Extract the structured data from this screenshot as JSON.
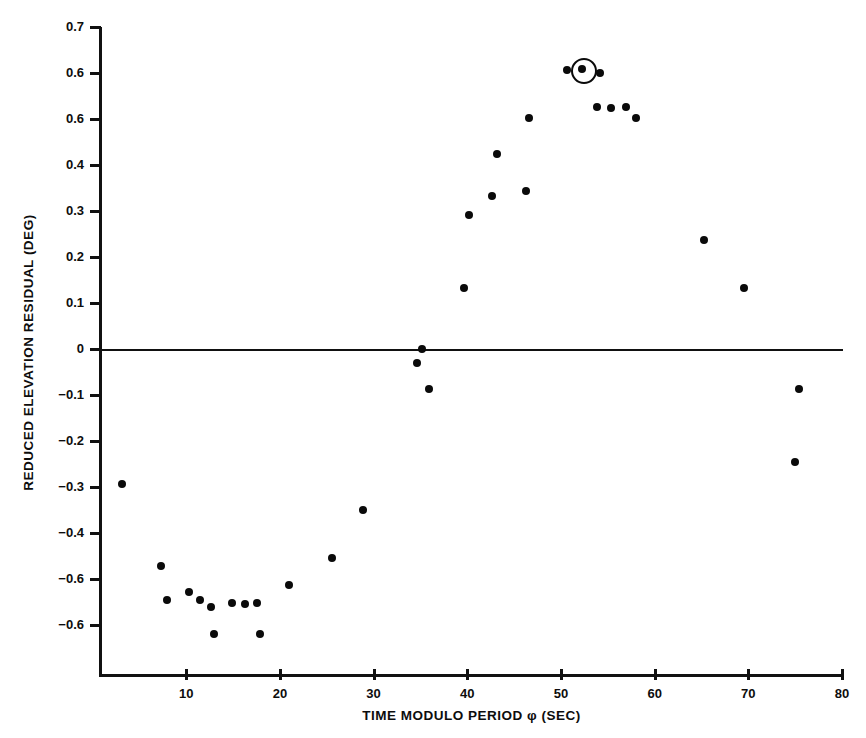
{
  "chart_data": {
    "type": "scatter",
    "title": "",
    "xlabel": "TIME MODULO PERIOD φ (SEC)",
    "ylabel": "REDUCED ELEVATION RESIDUAL (DEG)",
    "xlim": [
      0.9,
      80
    ],
    "ylim": [
      -0.66,
      0.7
    ],
    "grid": false,
    "legend": null,
    "xticks": [
      10,
      20,
      30,
      40,
      50,
      60,
      70,
      80
    ],
    "xtick_labels": [
      "10",
      "20",
      "30",
      "40",
      "50",
      "60",
      "70",
      "80"
    ],
    "yticks": [
      0.7,
      0.6,
      0.5,
      0.4,
      0.3,
      0.2,
      0.1,
      0.0,
      -0.1,
      -0.2,
      -0.3,
      -0.4,
      -0.5,
      -0.6
    ],
    "ytick_labels": [
      "0.7",
      "0.6",
      "0.6",
      "0.4",
      "0.3",
      "0.2",
      "0.1",
      "0",
      "−0.1",
      "−0.2",
      "−0.3",
      "−0.4",
      "−0.6",
      "−0.6"
    ],
    "zero_reference_line": 0.0,
    "series": [
      {
        "name": "reduced elevation residual",
        "marker": "filled-circle",
        "color": "#0a0a0a",
        "points": [
          {
            "x": 3.1,
            "y": -0.294
          },
          {
            "x": 7.3,
            "y": -0.472
          },
          {
            "x": 7.9,
            "y": -0.545
          },
          {
            "x": 10.3,
            "y": -0.528
          },
          {
            "x": 11.5,
            "y": -0.545
          },
          {
            "x": 12.6,
            "y": -0.56
          },
          {
            "x": 13.0,
            "y": -0.62
          },
          {
            "x": 14.9,
            "y": -0.553
          },
          {
            "x": 16.3,
            "y": -0.555
          },
          {
            "x": 17.6,
            "y": -0.553
          },
          {
            "x": 17.9,
            "y": -0.62
          },
          {
            "x": 21.0,
            "y": -0.512
          },
          {
            "x": 25.6,
            "y": -0.455
          },
          {
            "x": 28.9,
            "y": -0.35
          },
          {
            "x": 34.6,
            "y": -0.03
          },
          {
            "x": 35.2,
            "y": 0.0
          },
          {
            "x": 35.9,
            "y": -0.088
          },
          {
            "x": 39.7,
            "y": 0.133
          },
          {
            "x": 40.2,
            "y": 0.291
          },
          {
            "x": 42.6,
            "y": 0.332
          },
          {
            "x": 43.2,
            "y": 0.424
          },
          {
            "x": 46.3,
            "y": 0.344
          },
          {
            "x": 46.6,
            "y": 0.503
          },
          {
            "x": 50.6,
            "y": 0.606
          },
          {
            "x": 52.2,
            "y": 0.608
          },
          {
            "x": 53.9,
            "y": 0.526
          },
          {
            "x": 54.2,
            "y": 0.6
          },
          {
            "x": 55.3,
            "y": 0.525
          },
          {
            "x": 56.9,
            "y": 0.526
          },
          {
            "x": 58.0,
            "y": 0.502
          },
          {
            "x": 65.3,
            "y": 0.238
          },
          {
            "x": 69.5,
            "y": 0.133
          },
          {
            "x": 75.4,
            "y": -0.086
          },
          {
            "x": 75.0,
            "y": -0.245
          }
        ]
      }
    ],
    "annotations": [
      {
        "kind": "highlight-circle",
        "x": 52.2,
        "y": 0.608,
        "description": "circled data point near peak"
      }
    ]
  }
}
